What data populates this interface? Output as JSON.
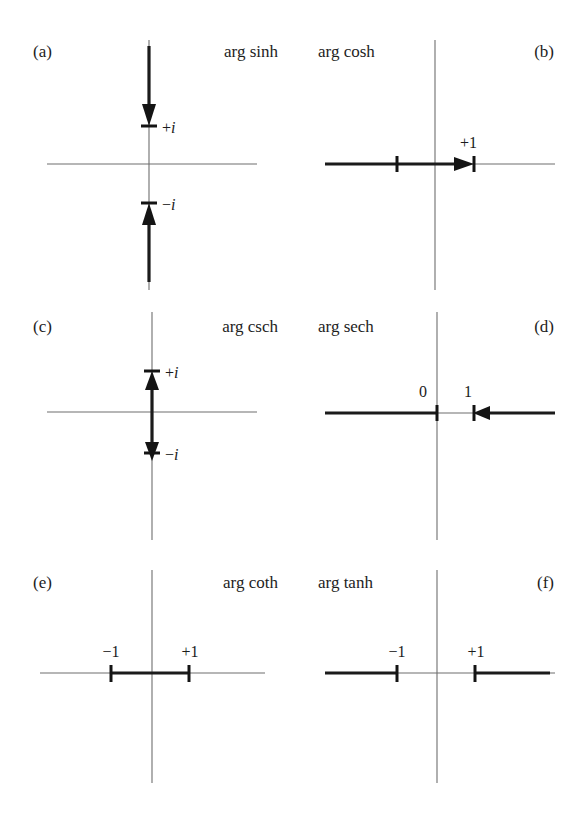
{
  "figure": {
    "background_color": "#ffffff",
    "axis_color": "#6e6e6e",
    "cut_color": "#1b1b1b",
    "panel_count": 6
  },
  "panels": [
    {
      "tag": "(a)",
      "name": "arg sinh",
      "tag_side": "left",
      "name_side": "right",
      "cut_orientation": "vertical",
      "branch_points": [
        "+i",
        "-i"
      ],
      "labels": [
        {
          "text_sign": "+",
          "text_unit": "i",
          "position": "+i"
        },
        {
          "text_sign": "−",
          "text_unit": "i",
          "position": "-i"
        }
      ],
      "description": "cuts along imaginary axis from +i upward and from -i downward; arrows point toward the branch points"
    },
    {
      "tag": "(b)",
      "name": "arg cosh",
      "tag_side": "right",
      "name_side": "left",
      "cut_orientation": "horizontal",
      "branch_points": [
        "+1",
        "-1"
      ],
      "labels": [
        {
          "text_sign": "+",
          "text_unit": "1",
          "position": "+1"
        }
      ],
      "description": "cut along real axis from minus infinity to +1; arrow points right toward +1; tick at -1"
    },
    {
      "tag": "(c)",
      "name": "arg csch",
      "tag_side": "left",
      "name_side": "right",
      "cut_orientation": "vertical",
      "branch_points": [
        "+i",
        "-i"
      ],
      "labels": [
        {
          "text_sign": "+",
          "text_unit": "i",
          "position": "+i"
        },
        {
          "text_sign": "−",
          "text_unit": "i",
          "position": "-i"
        }
      ],
      "description": "cut along imaginary axis between -i and +i; arrows point outward from origin to the branch points"
    },
    {
      "tag": "(d)",
      "name": "arg sech",
      "tag_side": "right",
      "name_side": "left",
      "cut_orientation": "horizontal",
      "branch_points": [
        "0",
        "1"
      ],
      "labels": [
        {
          "text_sign": "",
          "text_unit": "0",
          "position": "0"
        },
        {
          "text_sign": "",
          "text_unit": "1",
          "position": "1"
        }
      ],
      "description": "cuts along real axis from minus infinity to 0 and from 1 to plus infinity; arrow points left toward 1"
    },
    {
      "tag": "(e)",
      "name": "arg coth",
      "tag_side": "left",
      "name_side": "right",
      "cut_orientation": "horizontal",
      "branch_points": [
        "-1",
        "+1"
      ],
      "labels": [
        {
          "text_sign": "−",
          "text_unit": "1",
          "position": "-1"
        },
        {
          "text_sign": "+",
          "text_unit": "1",
          "position": "+1"
        }
      ],
      "description": "cut along real axis between -1 and +1; ticks at both endpoints; no arrows"
    },
    {
      "tag": "(f)",
      "name": "arg tanh",
      "tag_side": "right",
      "name_side": "left",
      "cut_orientation": "horizontal",
      "branch_points": [
        "-1",
        "+1"
      ],
      "labels": [
        {
          "text_sign": "−",
          "text_unit": "1",
          "position": "-1"
        },
        {
          "text_sign": "+",
          "text_unit": "1",
          "position": "+1"
        }
      ],
      "description": "cuts along real axis from minus infinity to -1 and from +1 to plus infinity; ticks at both endpoints"
    }
  ]
}
